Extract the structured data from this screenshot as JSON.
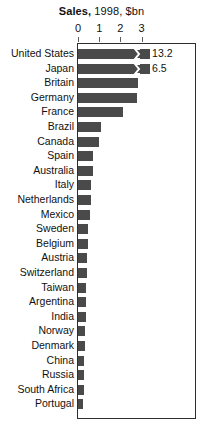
{
  "chart_data": {
    "type": "bar",
    "orientation": "horizontal",
    "title_bold": "Sales,",
    "title_rest": "1998, $bn",
    "title": "Sales, 1998, $bn",
    "xlabel": "",
    "ylabel": "",
    "xlim": [
      0,
      3.55
    ],
    "grid": false,
    "legend": null,
    "axis_ticks": [
      "0",
      "1",
      "2",
      "3"
    ],
    "axis_tick_values": [
      0,
      1,
      2,
      3
    ],
    "categories": [
      "United States",
      "Japan",
      "Britain",
      "Germany",
      "France",
      "Brazil",
      "Canada",
      "Spain",
      "Australia",
      "Italy",
      "Netherlands",
      "Mexico",
      "Sweden",
      "Belgium",
      "Austria",
      "Switzerland",
      "Taiwan",
      "Argentina",
      "India",
      "Norway",
      "Denmark",
      "China",
      "Russia",
      "South Africa",
      "Portugal"
    ],
    "values": [
      13.2,
      6.5,
      2.85,
      2.8,
      2.1,
      1.1,
      0.98,
      0.72,
      0.7,
      0.62,
      0.6,
      0.58,
      0.48,
      0.45,
      0.44,
      0.42,
      0.4,
      0.38,
      0.36,
      0.33,
      0.31,
      0.3,
      0.28,
      0.27,
      0.25
    ],
    "truncated_bars": [
      {
        "category": "United States",
        "value_label": "13.2",
        "drawn_to": 3.4
      },
      {
        "category": "Japan",
        "value_label": "6.5",
        "drawn_to": 3.4
      }
    ],
    "bar_color": "#4a4a4a",
    "frame_color": "#2e2e2e",
    "background": "#ffffff"
  },
  "icons": {
    "axis_break": "axis-break-zigzag-icon"
  }
}
